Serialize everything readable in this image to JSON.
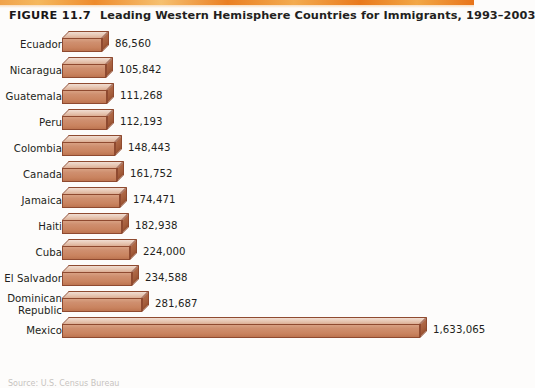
{
  "figure": {
    "number_label": "FIGURE 11.7",
    "title": "Leading Western Hemisphere Countries for Immigrants, 1993–2003"
  },
  "source_note": "Source: U.S. Census Bureau",
  "colors": {
    "bar_front": "#cd8e70",
    "bar_top": "#e7c6b2",
    "bar_side": "#a45d3c",
    "bar_outline": "#8f4a30",
    "text": "#231f20",
    "rule_orange": "#ee8b2c",
    "background": "#fdfcfb"
  },
  "chart_data": {
    "type": "bar",
    "orientation": "horizontal",
    "title": "Leading Western Hemisphere Countries for Immigrants, 1993–2003",
    "xlabel": "",
    "ylabel": "",
    "grid": false,
    "legend": "none",
    "xlim": [
      0,
      1633065
    ],
    "categories": [
      "Ecuador",
      "Nicaragua",
      "Guatemala",
      "Peru",
      "Colombia",
      "Canada",
      "Jamaica",
      "Haiti",
      "Cuba",
      "El Salvador",
      "Dominican Republic",
      "Mexico"
    ],
    "values": [
      86560,
      105842,
      111268,
      112193,
      148443,
      161752,
      174471,
      182938,
      224000,
      234588,
      281687,
      1633065
    ],
    "value_labels": [
      "86,560",
      "105,842",
      "111,268",
      "112,193",
      "148,443",
      "161,752",
      "174,471",
      "182,938",
      "224,000",
      "234,588",
      "281,687",
      "1,633,065"
    ]
  },
  "rows": [
    {
      "label_lines": [
        "Ecuador"
      ],
      "value_label": "86,560",
      "value": 86560
    },
    {
      "label_lines": [
        "Nicaragua"
      ],
      "value_label": "105,842",
      "value": 105842
    },
    {
      "label_lines": [
        "Guatemala"
      ],
      "value_label": "111,268",
      "value": 111268
    },
    {
      "label_lines": [
        "Peru"
      ],
      "value_label": "112,193",
      "value": 112193
    },
    {
      "label_lines": [
        "Colombia"
      ],
      "value_label": "148,443",
      "value": 148443
    },
    {
      "label_lines": [
        "Canada"
      ],
      "value_label": "161,752",
      "value": 161752
    },
    {
      "label_lines": [
        "Jamaica"
      ],
      "value_label": "174,471",
      "value": 174471
    },
    {
      "label_lines": [
        "Haiti"
      ],
      "value_label": "182,938",
      "value": 182938
    },
    {
      "label_lines": [
        "Cuba"
      ],
      "value_label": "224,000",
      "value": 224000
    },
    {
      "label_lines": [
        "El Salvador"
      ],
      "value_label": "234,588",
      "value": 234588
    },
    {
      "label_lines": [
        "Dominican",
        "Republic"
      ],
      "value_label": "281,687",
      "value": 281687
    },
    {
      "label_lines": [
        "Mexico"
      ],
      "value_label": "1,633,065",
      "value": 1633065
    }
  ]
}
